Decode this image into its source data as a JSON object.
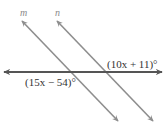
{
  "diagram": {
    "type": "parallel-lines-transversal",
    "lines": [
      {
        "id": "m",
        "label": "m",
        "color": "#8e8e8e",
        "x1": 22,
        "y1": 21,
        "x2": 118,
        "y2": 121
      },
      {
        "id": "n",
        "label": "n",
        "color": "#8e8e8e",
        "x1": 57,
        "y1": 21,
        "x2": 153,
        "y2": 121
      },
      {
        "id": "transversal",
        "label": "",
        "color": "#555555",
        "x1": 4,
        "y1": 72,
        "x2": 162,
        "y2": 72
      }
    ],
    "labels": {
      "line_m": "m",
      "line_n": "n",
      "angle_upper_right": "(10x + 11)°",
      "angle_lower_left": "(15x − 54)°"
    }
  }
}
